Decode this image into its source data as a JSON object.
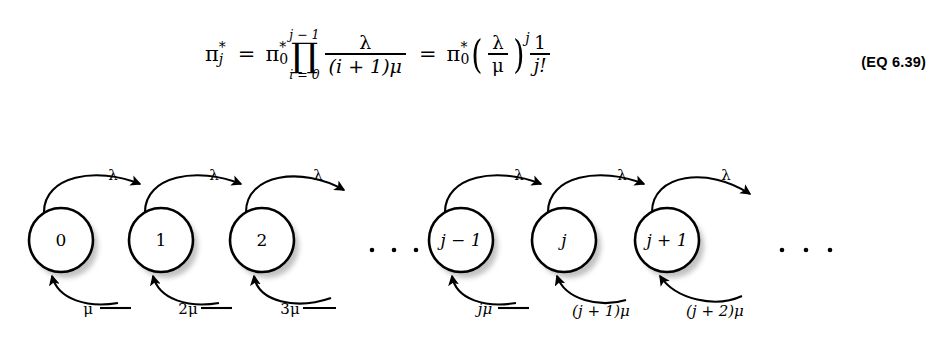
{
  "equation": {
    "lhs": {
      "symbol": "π",
      "sub": "j",
      "sup": "*"
    },
    "eq1": "=",
    "term1": {
      "symbol": "π",
      "sub": "0",
      "sup": "*"
    },
    "product": {
      "glyph": "∏",
      "upper": "j − 1",
      "lower": "i = 0",
      "fraction": {
        "numerator": "λ",
        "denominator": "(i + 1)μ"
      }
    },
    "eq2": "=",
    "term2": {
      "symbol": "π",
      "sub": "0",
      "sup": "*"
    },
    "parenfraction": {
      "numerator": "λ",
      "denominator": "μ"
    },
    "exponent": "j",
    "lastfraction": {
      "numerator": "1",
      "denominator": "j!"
    },
    "number": "(EQ 6.39)"
  },
  "diagram": {
    "type": "birth-death-markov-chain",
    "nodes": [
      {
        "id": "n0",
        "label": "0",
        "italic": false,
        "cx": 61,
        "cy": 100
      },
      {
        "id": "n1",
        "label": "1",
        "italic": false,
        "cx": 161,
        "cy": 100
      },
      {
        "id": "n2",
        "label": "2",
        "italic": false,
        "cx": 262,
        "cy": 100
      },
      {
        "id": "njm1",
        "label": "j − 1",
        "italic": true,
        "cx": 461,
        "cy": 100
      },
      {
        "id": "nj",
        "label": "j",
        "italic": true,
        "cx": 564,
        "cy": 100
      },
      {
        "id": "njp1",
        "label": "j + 1",
        "italic": true,
        "cx": 667,
        "cy": 100
      }
    ],
    "node_radius": 32,
    "ellipses": [
      {
        "name": "middle-ellipsis",
        "dots": [
          372,
          394,
          416
        ],
        "y": 110
      },
      {
        "name": "right-ellipsis",
        "dots": [
          782,
          806,
          830
        ],
        "y": 110
      }
    ],
    "arrivals": [
      {
        "from": "n0",
        "to": "n1",
        "label": "λ",
        "lx": 113,
        "ly": 35
      },
      {
        "from": "n1",
        "to": "n2",
        "label": "λ",
        "lx": 214,
        "ly": 35
      },
      {
        "from": "n2",
        "to": "next",
        "label": "λ",
        "lx": 323,
        "ly": 35
      },
      {
        "from": "prev",
        "to": "njm1",
        "label": "λ",
        "lx": 519,
        "ly": 35
      },
      {
        "from": "njm1",
        "to": "nj",
        "label": "λ",
        "lx": 622,
        "ly": 35
      },
      {
        "from": "njp1",
        "to": "next",
        "label": "λ",
        "lx": 728,
        "ly": 35
      }
    ],
    "departures": [
      {
        "from": "n1",
        "to": "n0",
        "label": "μ",
        "italic": false,
        "lx": 88,
        "ly": 172
      },
      {
        "from": "n2",
        "to": "n1",
        "label": "2μ",
        "italic": false,
        "lx": 187,
        "ly": 172
      },
      {
        "from": "next",
        "to": "n2",
        "label": "3μ",
        "italic": false,
        "lx": 291,
        "ly": 172
      },
      {
        "from": "njm1",
        "to": "prev",
        "label": "jμ",
        "italic": true,
        "lx": 484,
        "ly": 172
      },
      {
        "from": "nj",
        "to": "njm1",
        "label": "(j + 1)μ",
        "italic": true,
        "lx": 600,
        "ly": 172
      },
      {
        "from": "njp1",
        "to": "nj",
        "label": "(j + 2)μ",
        "italic": true,
        "lx": 714,
        "ly": 172
      }
    ]
  }
}
